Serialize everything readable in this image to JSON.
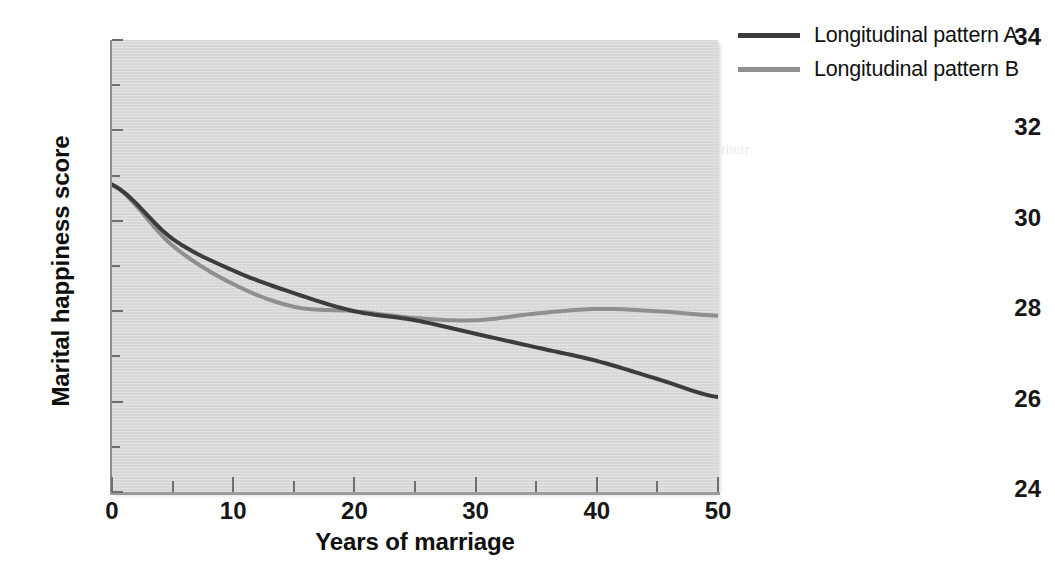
{
  "chart_data": {
    "type": "line",
    "title": "",
    "subtitle": "",
    "xlabel": "Years of marriage",
    "ylabel": "Marital happiness score",
    "xlim": [
      0,
      50
    ],
    "ylim": [
      24,
      34
    ],
    "x_major_ticks": [
      0,
      10,
      20,
      30,
      40,
      50
    ],
    "x_minor_ticks": [
      5,
      15,
      25,
      35,
      45
    ],
    "y_major_ticks": [
      24,
      26,
      28,
      30,
      32,
      34
    ],
    "y_minor_ticks": [
      25,
      27,
      29,
      31,
      33
    ],
    "x_tick_labels": [
      "0",
      "10",
      "20",
      "30",
      "40",
      "50"
    ],
    "y_tick_labels": [
      "24",
      "26",
      "28",
      "30",
      "32",
      "34"
    ],
    "grid": false,
    "legend_position": "top-right",
    "plot_background_color": "#d8d8d8",
    "figure_background_color": "#ffffff",
    "series": [
      {
        "name": "Longitudinal pattern A",
        "color": "#3c3c3c",
        "line_width": 4,
        "x": [
          0,
          5,
          10,
          15,
          20,
          25,
          30,
          35,
          40,
          45,
          50
        ],
        "values": [
          30.8,
          29.6,
          28.9,
          28.4,
          28.0,
          27.8,
          27.5,
          27.2,
          26.9,
          26.5,
          26.1
        ]
      },
      {
        "name": "Longitudinal pattern B",
        "color": "#8f8f8f",
        "line_width": 4,
        "x": [
          0,
          5,
          10,
          15,
          20,
          25,
          30,
          35,
          40,
          45,
          50
        ],
        "values": [
          30.8,
          29.45,
          28.6,
          28.1,
          28.0,
          27.85,
          27.8,
          27.95,
          28.05,
          28.0,
          27.9
        ]
      }
    ]
  },
  "axes": {
    "y_title": "Marital happiness score",
    "x_title": "Years of marriage"
  },
  "legend": {
    "entries": [
      {
        "label": "Longitudinal pattern A",
        "color": "#3c3c3c"
      },
      {
        "label": "Longitudinal pattern B",
        "color": "#8f8f8f"
      }
    ]
  }
}
